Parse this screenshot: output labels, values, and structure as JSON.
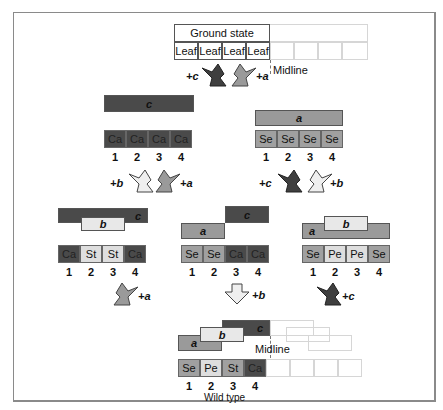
{
  "diagram": {
    "title_box": "Ground state",
    "midline_label": "Midline",
    "ground_state": {
      "cells": [
        "Leaf",
        "Leaf",
        "Leaf",
        "Leaf"
      ]
    },
    "arrows_top": [
      {
        "label": "+c",
        "shade": "dark"
      },
      {
        "label": "+a",
        "shade": "mid"
      }
    ],
    "level1": [
      {
        "bar": "c",
        "bar_shade": "dark",
        "cells": [
          "Ca",
          "Ca",
          "Ca",
          "Ca"
        ],
        "positions": [
          "1",
          "2",
          "3",
          "4"
        ],
        "arrows": [
          {
            "label": "+b",
            "shade": "light"
          },
          {
            "label": "+a",
            "shade": "mid"
          }
        ]
      },
      {
        "bar": "a",
        "bar_shade": "mid",
        "cells": [
          "Se",
          "Se",
          "Se",
          "Se"
        ],
        "positions": [
          "1",
          "2",
          "3",
          "4"
        ],
        "arrows": [
          {
            "label": "+c",
            "shade": "dark"
          },
          {
            "label": "+b",
            "shade": "light"
          }
        ]
      }
    ],
    "level2": [
      {
        "bars": [
          "c",
          "b"
        ],
        "cells": [
          "Ca",
          "St",
          "St",
          "Ca"
        ],
        "positions": [
          "1",
          "2",
          "3",
          "4"
        ],
        "arrow": {
          "label": "+a",
          "shade": "mid"
        }
      },
      {
        "bars": [
          "a",
          "c"
        ],
        "cells": [
          "Se",
          "Se",
          "Ca",
          "Ca"
        ],
        "positions": [
          "1",
          "2",
          "3",
          "4"
        ],
        "arrow": {
          "label": "+b",
          "shade": "light"
        }
      },
      {
        "bars": [
          "a",
          "b"
        ],
        "cells": [
          "Se",
          "Pe",
          "Pe",
          "Se"
        ],
        "positions": [
          "1",
          "2",
          "3",
          "4"
        ],
        "arrow": {
          "label": "+c",
          "shade": "dark"
        }
      }
    ],
    "wild_type": {
      "bars": [
        "a",
        "b",
        "c"
      ],
      "cells": [
        "Se",
        "Pe",
        "St",
        "Ca"
      ],
      "positions": [
        "1",
        "2",
        "3",
        "4"
      ],
      "label": "Wild type",
      "midline_label": "Midline"
    },
    "colors": {
      "dark": "#4a4a4a",
      "mid": "#9a9a9a",
      "light": "#e8e8e8",
      "frame": "#8a8a8a"
    }
  }
}
